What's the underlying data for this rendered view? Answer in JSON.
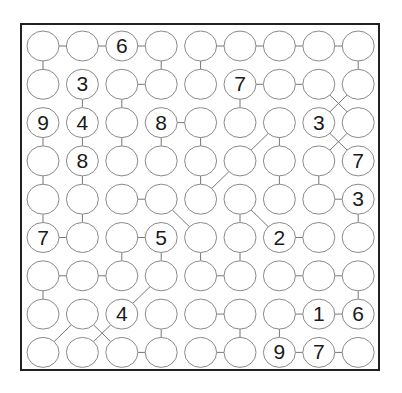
{
  "puzzle": {
    "type": "number-link-circles",
    "rows": 9,
    "cols": 9,
    "grid": [
      [
        "",
        "",
        "6",
        "",
        "",
        "",
        "",
        "",
        ""
      ],
      [
        "",
        "3",
        "",
        "",
        "",
        "7",
        "",
        "",
        ""
      ],
      [
        "9",
        "4",
        "",
        "8",
        "",
        "",
        "",
        "3",
        ""
      ],
      [
        "",
        "8",
        "",
        "",
        "",
        "",
        "",
        "",
        "7"
      ],
      [
        "",
        "",
        "",
        "",
        "",
        "",
        "",
        "",
        "3"
      ],
      [
        "7",
        "",
        "",
        "5",
        "",
        "",
        "2",
        "",
        ""
      ],
      [
        "",
        "",
        "",
        "",
        "",
        "",
        "",
        "",
        ""
      ],
      [
        "",
        "",
        "4",
        "",
        "",
        "",
        "",
        "1",
        "6"
      ],
      [
        "",
        "",
        "",
        "",
        "",
        "",
        "9",
        "7",
        ""
      ]
    ],
    "links": [
      [
        [
          0,
          0
        ],
        [
          0,
          1
        ]
      ],
      [
        [
          0,
          1
        ],
        [
          0,
          2
        ]
      ],
      [
        [
          0,
          2
        ],
        [
          0,
          3
        ]
      ],
      [
        [
          0,
          4
        ],
        [
          0,
          5
        ]
      ],
      [
        [
          0,
          5
        ],
        [
          0,
          6
        ]
      ],
      [
        [
          0,
          6
        ],
        [
          0,
          7
        ]
      ],
      [
        [
          0,
          7
        ],
        [
          0,
          8
        ]
      ],
      [
        [
          0,
          0
        ],
        [
          1,
          0
        ]
      ],
      [
        [
          0,
          3
        ],
        [
          1,
          3
        ]
      ],
      [
        [
          0,
          4
        ],
        [
          1,
          4
        ]
      ],
      [
        [
          0,
          8
        ],
        [
          1,
          8
        ]
      ],
      [
        [
          1,
          2
        ],
        [
          1,
          3
        ]
      ],
      [
        [
          1,
          5
        ],
        [
          1,
          6
        ]
      ],
      [
        [
          1,
          6
        ],
        [
          1,
          7
        ]
      ],
      [
        [
          1,
          1
        ],
        [
          2,
          1
        ]
      ],
      [
        [
          1,
          2
        ],
        [
          2,
          2
        ]
      ],
      [
        [
          1,
          5
        ],
        [
          2,
          5
        ]
      ],
      [
        [
          1,
          7
        ],
        [
          2,
          8
        ]
      ],
      [
        [
          1,
          8
        ],
        [
          2,
          7
        ]
      ],
      [
        [
          2,
          3
        ],
        [
          2,
          4
        ]
      ],
      [
        [
          2,
          0
        ],
        [
          3,
          0
        ]
      ],
      [
        [
          2,
          1
        ],
        [
          3,
          1
        ]
      ],
      [
        [
          2,
          2
        ],
        [
          3,
          2
        ]
      ],
      [
        [
          2,
          3
        ],
        [
          3,
          3
        ]
      ],
      [
        [
          2,
          4
        ],
        [
          3,
          4
        ]
      ],
      [
        [
          2,
          6
        ],
        [
          3,
          6
        ]
      ],
      [
        [
          2,
          6
        ],
        [
          3,
          5
        ]
      ],
      [
        [
          2,
          7
        ],
        [
          3,
          8
        ]
      ],
      [
        [
          2,
          8
        ],
        [
          3,
          7
        ]
      ],
      [
        [
          3,
          0
        ],
        [
          4,
          0
        ]
      ],
      [
        [
          3,
          1
        ],
        [
          4,
          1
        ]
      ],
      [
        [
          3,
          4
        ],
        [
          4,
          4
        ]
      ],
      [
        [
          3,
          6
        ],
        [
          4,
          6
        ]
      ],
      [
        [
          3,
          7
        ],
        [
          4,
          7
        ]
      ],
      [
        [
          3,
          5
        ],
        [
          4,
          4
        ]
      ],
      [
        [
          4,
          2
        ],
        [
          4,
          3
        ]
      ],
      [
        [
          4,
          7
        ],
        [
          4,
          8
        ]
      ],
      [
        [
          4,
          0
        ],
        [
          5,
          0
        ]
      ],
      [
        [
          4,
          1
        ],
        [
          5,
          1
        ]
      ],
      [
        [
          4,
          5
        ],
        [
          5,
          5
        ]
      ],
      [
        [
          4,
          8
        ],
        [
          5,
          8
        ]
      ],
      [
        [
          4,
          3
        ],
        [
          5,
          4
        ]
      ],
      [
        [
          4,
          5
        ],
        [
          5,
          6
        ]
      ],
      [
        [
          5,
          0
        ],
        [
          5,
          1
        ]
      ],
      [
        [
          5,
          2
        ],
        [
          5,
          3
        ]
      ],
      [
        [
          5,
          6
        ],
        [
          5,
          7
        ]
      ],
      [
        [
          5,
          2
        ],
        [
          6,
          2
        ]
      ],
      [
        [
          5,
          3
        ],
        [
          6,
          3
        ]
      ],
      [
        [
          5,
          4
        ],
        [
          6,
          4
        ]
      ],
      [
        [
          5,
          5
        ],
        [
          6,
          5
        ]
      ],
      [
        [
          6,
          0
        ],
        [
          6,
          1
        ]
      ],
      [
        [
          6,
          1
        ],
        [
          6,
          2
        ]
      ],
      [
        [
          6,
          4
        ],
        [
          6,
          5
        ]
      ],
      [
        [
          6,
          6
        ],
        [
          6,
          7
        ]
      ],
      [
        [
          6,
          7
        ],
        [
          6,
          8
        ]
      ],
      [
        [
          6,
          0
        ],
        [
          7,
          0
        ]
      ],
      [
        [
          6,
          8
        ],
        [
          7,
          8
        ]
      ],
      [
        [
          6,
          3
        ],
        [
          7,
          2
        ]
      ],
      [
        [
          7,
          4
        ],
        [
          7,
          5
        ]
      ],
      [
        [
          7,
          6
        ],
        [
          7,
          7
        ]
      ],
      [
        [
          7,
          7
        ],
        [
          7,
          8
        ]
      ],
      [
        [
          7,
          3
        ],
        [
          8,
          3
        ]
      ],
      [
        [
          7,
          5
        ],
        [
          8,
          5
        ]
      ],
      [
        [
          7,
          6
        ],
        [
          8,
          6
        ]
      ],
      [
        [
          7,
          1
        ],
        [
          8,
          0
        ]
      ],
      [
        [
          7,
          1
        ],
        [
          8,
          2
        ]
      ],
      [
        [
          7,
          2
        ],
        [
          8,
          1
        ]
      ],
      [
        [
          8,
          2
        ],
        [
          8,
          3
        ]
      ],
      [
        [
          8,
          4
        ],
        [
          8,
          5
        ]
      ],
      [
        [
          8,
          6
        ],
        [
          8,
          7
        ]
      ],
      [
        [
          8,
          7
        ],
        [
          8,
          8
        ]
      ]
    ]
  },
  "style": {
    "circle_stroke": "#8a8a8a",
    "link_stroke": "#777777",
    "frame": "#222222",
    "text": "#1a1a1a"
  }
}
